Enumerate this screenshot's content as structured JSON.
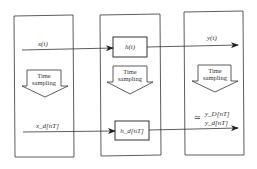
{
  "diagram": {
    "panels": [
      {
        "name": "input-panel",
        "top_signal": "x(t)",
        "sampling_label_line1": "Time",
        "sampling_label_line2": "sampling",
        "bottom_signal": "x_d[nT]"
      },
      {
        "name": "system-panel",
        "top_block": "h(t)",
        "sampling_label_line1": "Time",
        "sampling_label_line2": "sampling",
        "bottom_block": "h_d[nT]"
      },
      {
        "name": "output-panel",
        "top_signal": "y(t)",
        "sampling_label_line1": "Time",
        "sampling_label_line2": "sampling",
        "approx_symbol": "≃",
        "bottom_signal_line1": "y_D[nT]",
        "bottom_signal_line2": "y_d[nT]"
      }
    ],
    "colors": {
      "stroke": "#333333",
      "background": "#ffffff"
    }
  }
}
